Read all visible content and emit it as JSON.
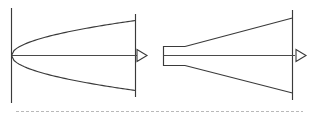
{
  "figure": {
    "canvas": {
      "width": 319,
      "height": 118,
      "background": "#ffffff"
    },
    "stroke_color": "#3a3a3a",
    "axis_color": "#4a4a4a",
    "rule_color": "#b9b9b9",
    "panels": [
      {
        "id": "left-panel",
        "name": "parabolic-profile-diagram",
        "description": "Parabolic velocity profile expanding from a point vertex to a full exit plane",
        "inlet_plane": {
          "x": 11,
          "y_top": 8,
          "y_bottom": 103
        },
        "exit_plane": {
          "x": 135,
          "y_top": 14,
          "y_bottom": 97
        },
        "centerline": {
          "y": 55,
          "x_start": 11,
          "x_end": 137
        },
        "vertex": {
          "x": 11,
          "y": 55
        },
        "upper_curve_end": {
          "x": 135,
          "y": 20
        },
        "lower_curve_end": {
          "x": 135,
          "y": 90
        },
        "curve_type": "parabola",
        "arrow": {
          "tip_x": 147,
          "base_x": 137,
          "half_height": 6,
          "style": "hollow-triangle"
        }
      },
      {
        "id": "right-panel",
        "name": "conical-nozzle-diagram",
        "description": "Straight-walled conical nozzle with a constant-area throat duct expanding linearly to the exit plane",
        "throat": {
          "x_start": 163,
          "x_end": 185,
          "y_top": 46,
          "y_bottom": 65
        },
        "exit_plane": {
          "x": 292,
          "y_top": 10,
          "y_bottom": 100
        },
        "centerline": {
          "y": 55,
          "x_start": 163,
          "x_end": 295
        },
        "upper_wall_end": {
          "x": 292,
          "y": 18
        },
        "lower_wall_end": {
          "x": 292,
          "y": 93
        },
        "curve_type": "straight-cone",
        "arrow": {
          "tip_x": 306,
          "base_x": 296,
          "half_height": 6,
          "style": "hollow-triangle"
        }
      }
    ],
    "footer_rule": {
      "name": "dashed-separator",
      "y": 111,
      "x_start": 16,
      "x_end": 303,
      "style": "dashed"
    }
  }
}
